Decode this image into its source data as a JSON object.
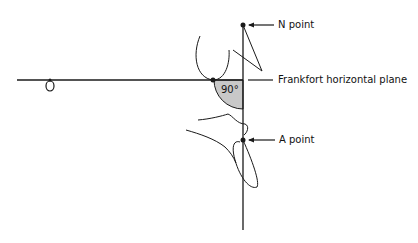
{
  "diagram": {
    "labels": {
      "n_point": "N point",
      "frankfort": "Frankfort horizontal plane",
      "a_point": "A point",
      "angle": "90°"
    },
    "colors": {
      "line": "#1a1a1a",
      "angle_fill": "#c8c8c8",
      "background": "#ffffff"
    }
  }
}
